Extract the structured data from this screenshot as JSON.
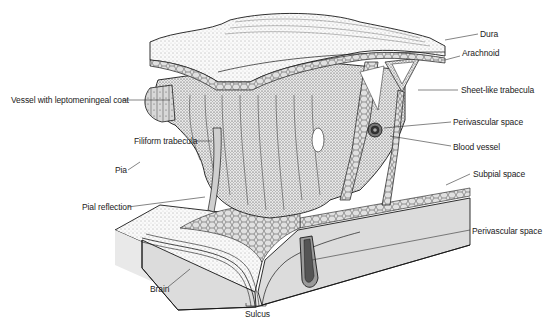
{
  "figure": {
    "type": "anatomical-illustration",
    "colors": {
      "background": "#ffffff",
      "ink": "#1a1a1a",
      "brain_face": "#dcdcdc",
      "stipple": "#5a5a5a",
      "label_text": "#222222"
    }
  },
  "labels": {
    "dura": "Dura",
    "arachnoid": "Arachnoid",
    "sheet_like_trabecula": "Sheet-like trabecula",
    "perivascular_space_upper": "Perivascular space",
    "blood_vessel": "Blood vessel",
    "subpial_space": "Subpial space",
    "perivascular_space_lower": "Perivascular space",
    "vessel_with_leptomeningeal_coat": "Vessel with leptomeningeal coat",
    "filiform_trabecula": "Filiform trabecula",
    "pia": "Pia",
    "pial_reflection": "Pial reflection",
    "brain": "Brain",
    "sulcus": "Sulcus"
  }
}
